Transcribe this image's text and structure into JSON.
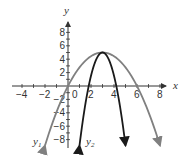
{
  "chart_data": {
    "type": "line",
    "title": "",
    "xlabel": "x",
    "ylabel": "y",
    "xlim": [
      -5,
      9
    ],
    "ylim": [
      -9,
      9
    ],
    "x_ticks": [
      -4,
      -2,
      0,
      2,
      4,
      6,
      8
    ],
    "y_ticks": [
      8,
      6,
      4,
      2,
      -2,
      -4,
      -6,
      -8
    ],
    "grid": false,
    "series": [
      {
        "name": "y1",
        "label": "y₁",
        "equation": "y = -5/9 (x - 3)^2 + 5",
        "a": -0.5556,
        "h": 3,
        "k": 5,
        "x_range": [
          -2,
          8
        ],
        "color": "#808080",
        "roots": [
          0,
          6
        ],
        "vertex": [
          3,
          5
        ]
      },
      {
        "name": "y2",
        "label": "y₂",
        "equation": "y = -3.47 (x - 3)^2 + 5",
        "a": -3.47,
        "h": 3,
        "k": 5,
        "x_range": [
          1,
          5
        ],
        "color": "#1a1a1a",
        "roots": [
          1.8,
          4.2
        ],
        "vertex": [
          3,
          5
        ]
      }
    ]
  },
  "labels": {
    "x_axis": "x",
    "y_axis": "y",
    "origin": "0",
    "y1": "y",
    "y1_sub": "1",
    "y2": "y",
    "y2_sub": "2"
  }
}
